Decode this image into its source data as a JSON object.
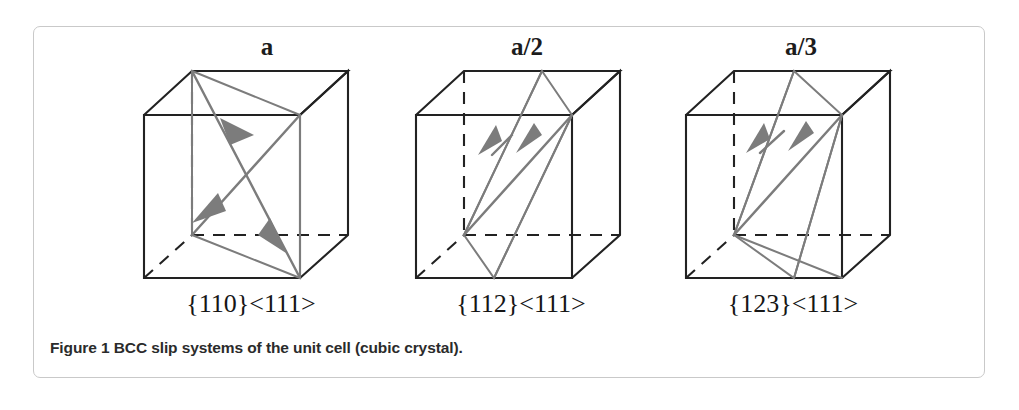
{
  "figure": {
    "caption": "Figure 1 BCC slip systems of the unit cell (cubic crystal).",
    "panel_border_color": "#c9c9c9",
    "background_color": "#ffffff",
    "edge_color": "#222222",
    "slip_color": "#7c7c7c"
  },
  "cubes": [
    {
      "top_label": "a",
      "bottom_label": "{110}<111>",
      "plane_family": "{110}",
      "direction_family": "<111>",
      "burgers_vector": "a"
    },
    {
      "top_label": "a/2",
      "bottom_label": "{112}<111>",
      "plane_family": "{112}",
      "direction_family": "<111>",
      "burgers_vector": "a/2"
    },
    {
      "top_label": "a/3",
      "bottom_label": "{123}<111>",
      "plane_family": "{123}",
      "direction_family": "<111>",
      "burgers_vector": "a/3"
    }
  ]
}
